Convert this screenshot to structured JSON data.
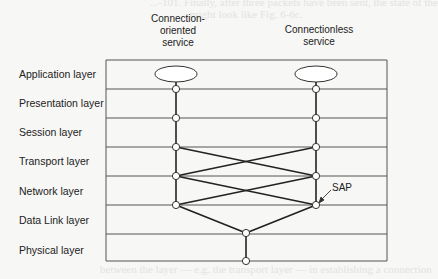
{
  "ghost": {
    "top_line1": "...-101. Finally, after three packets have been sent, the state of the",
    "top_line2": "might look like Fig. 6-6c.",
    "bottom_line1": "between the layer — e.g. the transport layer — in establishing a connection",
    "bottom_line2": "... After these steps, the interface is ready for use as requested."
  },
  "headers": {
    "connection_oriented": [
      "Connection-",
      "oriented",
      "service"
    ],
    "connectionless": [
      "Connectionless",
      "service"
    ]
  },
  "layers": [
    {
      "label": "Application layer"
    },
    {
      "label": "Presentation layer"
    },
    {
      "label": "Session layer"
    },
    {
      "label": "Transport layer"
    },
    {
      "label": "Network layer"
    },
    {
      "label": "Data Link layer"
    },
    {
      "label": "Physical layer"
    }
  ],
  "annotations": {
    "sap": "SAP"
  },
  "colors": {
    "line": "#2a2a2a",
    "thin_line": "#555555",
    "node_fill": "#ffffff"
  }
}
